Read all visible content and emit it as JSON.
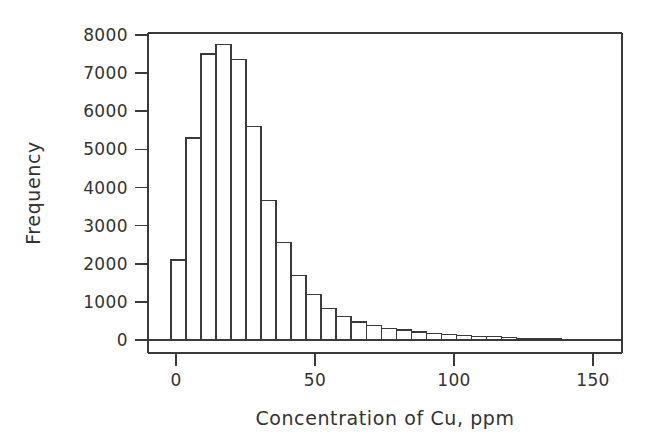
{
  "chart_data": {
    "type": "bar",
    "title": "",
    "subtitle": "",
    "xlabel": "Concentration of Cu, ppm",
    "ylabel": "Frequency",
    "xlim": [
      -6,
      160
    ],
    "ylim": [
      0,
      8000
    ],
    "grid": false,
    "legend": null,
    "legend_position": "none",
    "bin_width": 5.4,
    "bin_start": -1.8,
    "x_ticks": [
      0,
      50,
      100,
      150
    ],
    "x_tick_labels": [
      "0",
      "50",
      "100",
      "150"
    ],
    "y_ticks": [
      0,
      1000,
      2000,
      3000,
      4000,
      5000,
      6000,
      7000,
      8000
    ],
    "y_tick_labels": [
      "0",
      "1000",
      "2000",
      "3000",
      "4000",
      "5000",
      "6000",
      "7000",
      "8000"
    ],
    "bin_centers": [
      0.9,
      6.3,
      11.7,
      17.1,
      22.5,
      27.9,
      33.3,
      38.7,
      44.1,
      49.5,
      54.9,
      60.3,
      65.7,
      71.1,
      76.5,
      81.9,
      87.3,
      92.7,
      98.1,
      103.5,
      108.9,
      114.3,
      119.7,
      125.1,
      130.5,
      135.9,
      141.3,
      146.7,
      152.1
    ],
    "values": [
      2100,
      5300,
      7500,
      7750,
      7350,
      5600,
      3650,
      2550,
      1700,
      1200,
      820,
      620,
      470,
      380,
      310,
      260,
      210,
      170,
      140,
      120,
      100,
      90,
      60,
      40,
      30,
      25,
      20,
      15,
      10
    ],
    "series": [
      {
        "name": "Concentration of Cu",
        "values": [
          2100,
          5300,
          7500,
          7750,
          7350,
          5600,
          3650,
          2550,
          1700,
          1200,
          820,
          620,
          470,
          380,
          310,
          260,
          210,
          170,
          140,
          120,
          100,
          90,
          60,
          40,
          30,
          25,
          20,
          15,
          10
        ]
      }
    ]
  },
  "colors": {
    "bar_fill": "#ffffff",
    "bar_stroke": "#3a3a3a",
    "axis": "#3a3a3a",
    "text": "#333333",
    "background": "#ffffff"
  }
}
